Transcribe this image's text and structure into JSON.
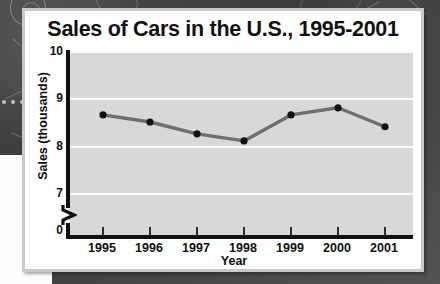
{
  "chart_data": {
    "type": "line",
    "title": "Sales of Cars in the U.S., 1995-2001",
    "xlabel": "Year",
    "ylabel": "Sales (thousands)",
    "categories": [
      "1995",
      "1996",
      "1997",
      "1998",
      "1999",
      "2000",
      "2001"
    ],
    "values": [
      8.65,
      8.5,
      8.25,
      8.1,
      8.65,
      8.8,
      8.4
    ],
    "series": [
      {
        "name": "Sales (thousands)",
        "values": [
          8.65,
          8.5,
          8.25,
          8.1,
          8.65,
          8.8,
          8.4
        ]
      }
    ],
    "ytick_labels": [
      "10",
      "9",
      "8",
      "7",
      "0"
    ],
    "ytick_values": [
      10,
      9,
      8,
      7,
      0
    ],
    "ylim": [
      7,
      10
    ],
    "y_axis_broken": true,
    "y_axis_break_between": [
      0,
      7
    ],
    "grid": true,
    "grid_axis": "y",
    "legend": "none",
    "line_color": "#6e6e6e",
    "marker_color": "#111111",
    "plot_background": "#d8d8d8",
    "gridline_color": "#fbfbfb"
  },
  "card": {
    "background": "#ffffff",
    "border_color": "#c9c9c9"
  },
  "axes": {
    "y_axis_title": "Sales (thousands)",
    "x_axis_title": "Year",
    "axis_color": "#111111",
    "break_symbol": "zigzag"
  },
  "backdrop": {
    "description": "dark chalkboard surface",
    "color": "#444444"
  }
}
